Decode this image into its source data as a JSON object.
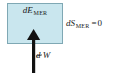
{
  "figure": {
    "type": "thermodynamic-system-diagram",
    "background_color": "#ffffff",
    "width": 124,
    "height": 73
  },
  "system_box": {
    "label_prefix": "d",
    "label_symbol": "E",
    "label_subscript": "MER",
    "fill_color": "#c9e6ee",
    "border_color": "#7fa8b4"
  },
  "entropy": {
    "prefix": "d",
    "symbol": "S",
    "subscript": "MER",
    "operator": "=",
    "value": "0"
  },
  "work": {
    "prefix": "d",
    "symbol": "W",
    "direction": "into-system",
    "arrow_color": "#111111"
  }
}
